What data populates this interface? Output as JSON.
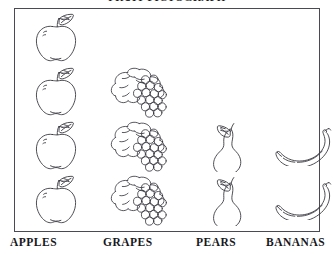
{
  "chart_data": {
    "type": "bar",
    "subtype": "pictogram",
    "title": "FRUIT PICTOGRAPH",
    "categories": [
      "APPLES",
      "GRAPES",
      "PEARS",
      "BANANAS"
    ],
    "values": [
      4,
      3,
      2,
      2
    ],
    "xlabel": "",
    "ylabel": "",
    "ylim": [
      0,
      4
    ],
    "grid": false,
    "legend": "none",
    "icons": [
      "apple-icon",
      "grapes-icon",
      "pear-icon",
      "banana-icon"
    ],
    "unit_note": "each icon = 1 unit",
    "style": {
      "fill": "#ffffff",
      "stroke": "#3a3a42",
      "frame_color": "#4a4a52",
      "background": "#ffffff",
      "text_color": "#17171c"
    }
  },
  "columns": [
    {
      "key": "apples",
      "label": "APPLES",
      "icon": "apple-icon",
      "count": 4,
      "left": 10,
      "col_left": 4
    },
    {
      "key": "grapes",
      "label": "GRAPES",
      "icon": "grapes-icon",
      "count": 3,
      "left": 103,
      "col_left": 88
    },
    {
      "key": "pears",
      "label": "PEARS",
      "icon": "pear-icon",
      "count": 2,
      "left": 196,
      "col_left": 172
    },
    {
      "key": "bananas",
      "label": "BANANAS",
      "icon": "banana-icon",
      "count": 2,
      "left": 266,
      "col_left": 248
    }
  ]
}
